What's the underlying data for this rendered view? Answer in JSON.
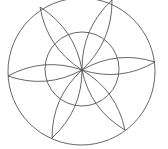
{
  "diagram": {
    "type": "geometric-rosette",
    "stroke_color": "#555555",
    "background": "#ffffff",
    "outer_circle": {
      "cx": 81.5,
      "cy": 71.5,
      "r": 73.5
    },
    "inner_circle": {
      "cx": 82,
      "cy": 69,
      "r": 37
    },
    "center": {
      "x": 82,
      "y": 70
    },
    "petal_bulge": 0.22,
    "petals": [
      {
        "id": "petal-top-left",
        "tip": {
          "x": 40,
          "y": 7
        }
      },
      {
        "id": "petal-top-right",
        "tip": {
          "x": 112,
          "y": 0
        }
      },
      {
        "id": "petal-right",
        "tip": {
          "x": 155,
          "y": 62
        }
      },
      {
        "id": "petal-bottom-right",
        "tip": {
          "x": 125,
          "y": 130
        }
      },
      {
        "id": "petal-bottom-left",
        "tip": {
          "x": 52,
          "y": 138
        }
      },
      {
        "id": "petal-left",
        "tip": {
          "x": 8,
          "y": 76
        }
      }
    ]
  }
}
